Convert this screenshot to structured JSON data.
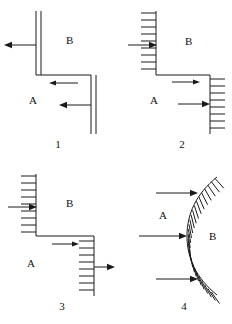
{
  "figure": {
    "background_color": "#ffffff",
    "ink_color": "#1a1a1a",
    "width": 232,
    "height": 324
  },
  "panels": [
    {
      "number": "1",
      "block_upper_label": "B",
      "block_lower_label": "A",
      "fault_style": "double-line",
      "arrows": [
        {
          "name": "upper-block-arrow",
          "direction": "left"
        },
        {
          "name": "mid-block-arrow",
          "direction": "left"
        },
        {
          "name": "lower-block-arrow",
          "direction": "left"
        }
      ]
    },
    {
      "number": "2",
      "block_upper_label": "B",
      "block_lower_label": "A",
      "fault_style": "hatched",
      "arrows": [
        {
          "name": "upper-block-arrow",
          "direction": "right"
        },
        {
          "name": "mid-block-arrow",
          "direction": "right"
        },
        {
          "name": "lower-block-arrow",
          "direction": "right"
        }
      ]
    },
    {
      "number": "3",
      "block_upper_label": "B",
      "block_lower_label": "A",
      "fault_style": "hatched",
      "arrows": [
        {
          "name": "upper-block-arrow",
          "direction": "right"
        },
        {
          "name": "mid-block-arrow",
          "direction": "right"
        },
        {
          "name": "lower-block-arrow",
          "direction": "right"
        }
      ]
    },
    {
      "number": "4",
      "block_upper_label": "A",
      "block_lower_label": "B",
      "fault_style": "curved-hatched",
      "arrows": [
        {
          "name": "upper-block-arrow",
          "direction": "right"
        },
        {
          "name": "mid-block-arrow",
          "direction": "right"
        },
        {
          "name": "lower-block-arrow",
          "direction": "right"
        }
      ]
    }
  ]
}
